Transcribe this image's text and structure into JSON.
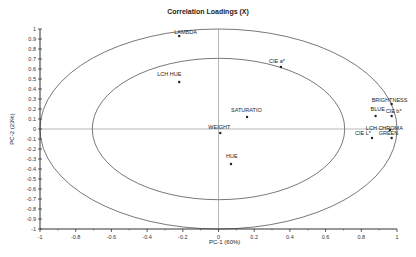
{
  "chart_data": {
    "type": "scatter",
    "title": "Correlation Loadings (X)",
    "xlabel": "PC-1 (60%)",
    "ylabel": "PC-2 (23%)",
    "xlim": [
      -1,
      1
    ],
    "ylim": [
      -1,
      1
    ],
    "x_ticks": [
      "-1",
      "-0.8",
      "-0.6",
      "-0.4",
      "-0.2",
      "0",
      "0.2",
      "0.4",
      "0.6",
      "0.8",
      "1"
    ],
    "y_ticks": [
      "1",
      "0.9",
      "0.8",
      "0.7",
      "0.6",
      "0.5",
      "0.4",
      "0.3",
      "0.2",
      "0.1",
      "0",
      "-0.1",
      "-0.2",
      "-0.3",
      "-0.4",
      "-0.5",
      "-0.6",
      "-0.7",
      "-0.8",
      "-0.9",
      "-1"
    ],
    "grid": false,
    "reference_ellipses": [
      {
        "name": "outer",
        "radius": 1.0
      },
      {
        "name": "inner",
        "radius": 0.707
      }
    ],
    "points": [
      {
        "label": "LAMBDA",
        "x": -0.22,
        "y": 0.93
      },
      {
        "label": "CIE a*",
        "x": 0.35,
        "y": 0.62
      },
      {
        "label": "LCH HUE",
        "x": -0.22,
        "y": 0.47
      },
      {
        "label": "SATURATIO",
        "x": 0.16,
        "y": 0.12
      },
      {
        "label": "WEIGHT",
        "x": 0.01,
        "y": -0.04
      },
      {
        "label": "HUE",
        "x": 0.07,
        "y": -0.35
      },
      {
        "label": "BRIGHTNESS",
        "x": 0.97,
        "y": 0.25
      },
      {
        "label": "BLUE",
        "x": 0.88,
        "y": 0.13
      },
      {
        "label": "CIE b*",
        "x": 0.97,
        "y": 0.13
      },
      {
        "label": "LCH CHROMA",
        "x": 0.96,
        "y": -0.01
      },
      {
        "label": "CIE L*",
        "x": 0.86,
        "y": -0.09
      },
      {
        "label": "GREEN",
        "x": 0.97,
        "y": -0.09
      }
    ]
  },
  "labels": {
    "title": "Correlation Loadings (X)",
    "xlabel": "PC-1 (60%)",
    "ylabel": "PC-2 (23%)"
  }
}
